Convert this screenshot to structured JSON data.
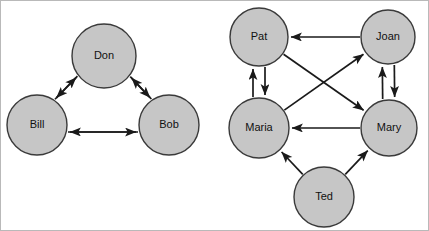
{
  "figure": {
    "background_color": "#ffffff",
    "frame_border_color": "#b9b9b9",
    "width": 429,
    "height": 231
  },
  "style": {
    "node_fill": "#c6c6c6",
    "node_stroke": "#3a3a3a",
    "edge_color": "#1a1a1a",
    "label_color": "#111111"
  },
  "graphs": [
    {
      "id": "left-graph",
      "name": "Triad Don Bill Bob",
      "nodes": [
        {
          "id": "don",
          "label": "Don",
          "cx": 103,
          "cy": 55,
          "r": 32
        },
        {
          "id": "bill",
          "label": "Bill",
          "cx": 36,
          "cy": 124,
          "r": 30
        },
        {
          "id": "bob",
          "label": "Bob",
          "cx": 168,
          "cy": 124,
          "r": 30
        }
      ],
      "edges": [
        {
          "id": "don-bill",
          "from": "Don",
          "to": "Bill",
          "offset": 5
        },
        {
          "id": "bill-don",
          "from": "Bill",
          "to": "Don",
          "offset": -5
        },
        {
          "id": "don-bob",
          "from": "Don",
          "to": "Bob",
          "offset": -5
        },
        {
          "id": "bob-don",
          "from": "Bob",
          "to": "Don",
          "offset": 5
        },
        {
          "id": "bob-bill",
          "from": "Bob",
          "to": "Bill",
          "offset": -7
        },
        {
          "id": "bill-bob",
          "from": "Bill",
          "to": "Bob",
          "offset": 7
        }
      ]
    },
    {
      "id": "right-graph",
      "name": "Group Pat Joan Maria Mary Ted",
      "nodes": [
        {
          "id": "pat",
          "label": "Pat",
          "cx": 258,
          "cy": 36,
          "r": 29
        },
        {
          "id": "joan",
          "label": "Joan",
          "cx": 387,
          "cy": 36,
          "r": 27
        },
        {
          "id": "maria",
          "label": "Maria",
          "cx": 258,
          "cy": 127,
          "r": 30
        },
        {
          "id": "mary",
          "label": "Mary",
          "cx": 388,
          "cy": 127,
          "r": 28
        },
        {
          "id": "ted",
          "label": "Ted",
          "cx": 323,
          "cy": 196,
          "r": 30
        }
      ],
      "edges": [
        {
          "id": "joan-pat",
          "from": "Joan",
          "to": "Pat",
          "offset": 0
        },
        {
          "id": "maria-pat",
          "from": "Maria",
          "to": "Pat",
          "offset": -6
        },
        {
          "id": "pat-maria",
          "from": "Pat",
          "to": "Maria",
          "offset": -6
        },
        {
          "id": "mary-joan",
          "from": "Mary",
          "to": "Joan",
          "offset": -6
        },
        {
          "id": "joan-mary",
          "from": "Joan",
          "to": "Mary",
          "offset": -6
        },
        {
          "id": "pat-mary",
          "from": "Pat",
          "to": "Mary",
          "offset": 0
        },
        {
          "id": "maria-joan",
          "from": "Maria",
          "to": "Joan",
          "offset": 0
        },
        {
          "id": "mary-maria",
          "from": "Mary",
          "to": "Maria",
          "offset": 0
        },
        {
          "id": "ted-maria",
          "from": "Ted",
          "to": "Maria",
          "offset": 0
        },
        {
          "id": "ted-mary",
          "from": "Ted",
          "to": "Mary",
          "offset": 0
        }
      ]
    }
  ]
}
